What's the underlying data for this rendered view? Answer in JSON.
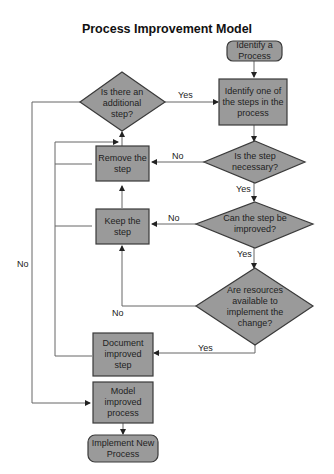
{
  "title": "Process Improvement Model",
  "colors": {
    "fill": "#9a9a9a",
    "stroke": "#3a3a3a",
    "line": "#555555"
  },
  "nodes": {
    "start": "Identify a Process",
    "identify_step": "Identify one of the steps in the process",
    "additional_step": "Is there an additional step?",
    "necessary": "Is the step necessary?",
    "remove": "Remove the step",
    "improved": "Can the step be improved?",
    "keep": "Keep the step",
    "resources": "Are resources available to implement the change?",
    "document": "Document improved step",
    "model": "Model improved process",
    "end": "Implement New Process"
  },
  "edges": {
    "additional_yes": "Yes",
    "necessary_no": "No",
    "necessary_yes": "Yes",
    "improved_no": "No",
    "improved_yes": "Yes",
    "resources_no": "No",
    "resources_yes": "Yes",
    "additional_no": "No"
  }
}
